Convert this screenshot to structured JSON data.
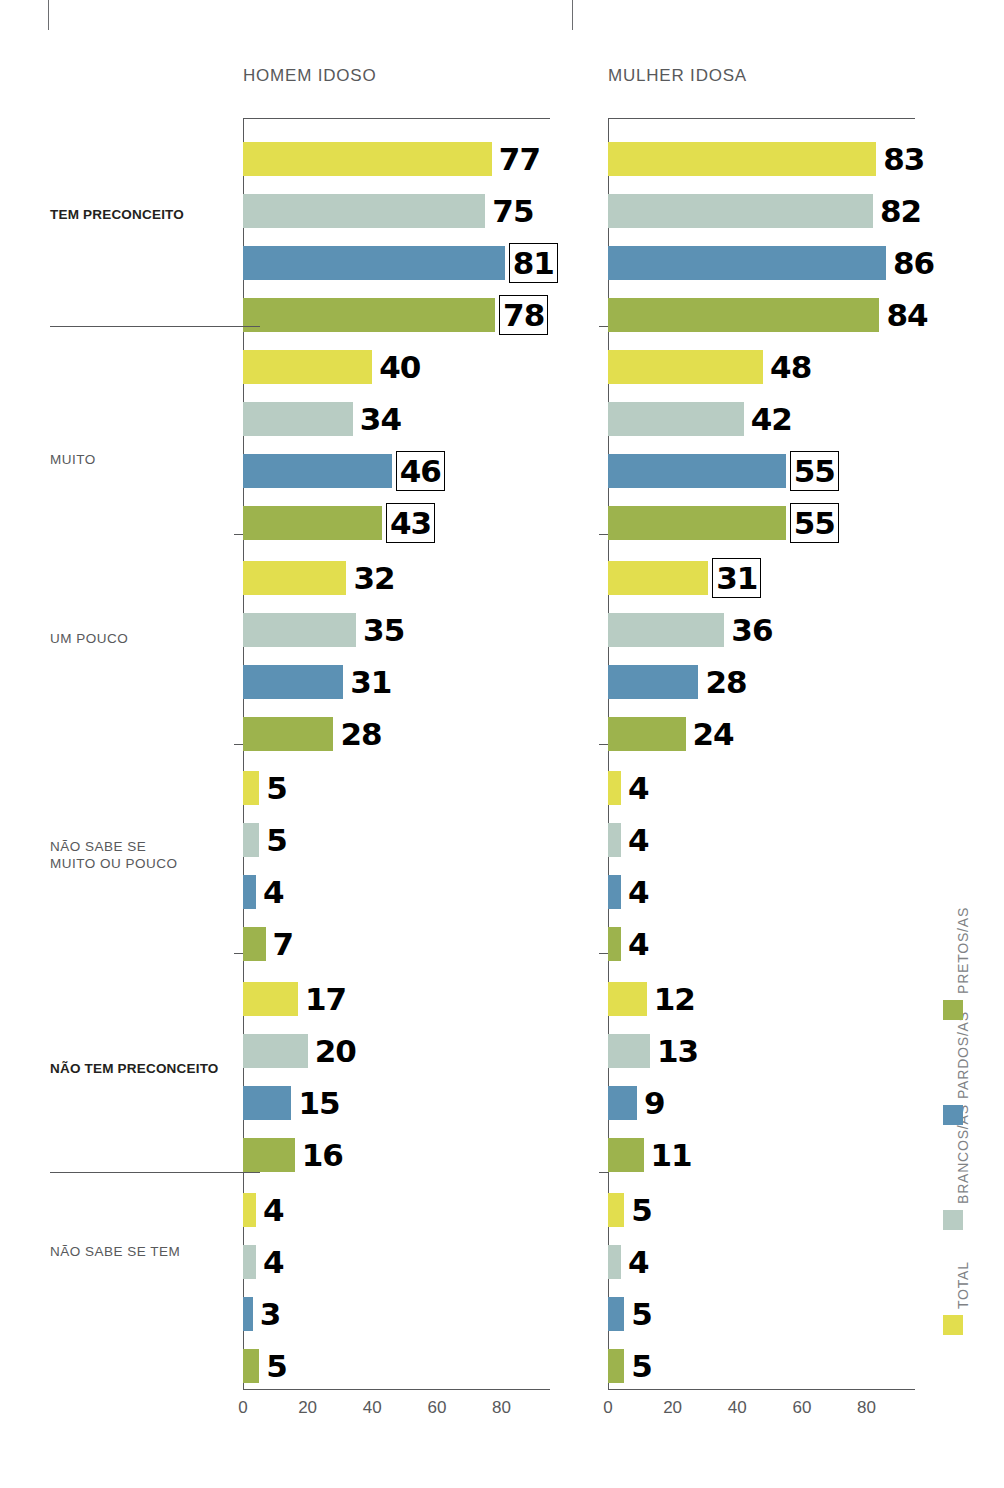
{
  "panels": [
    {
      "id": "homem",
      "title": "HOMEM IDOSO"
    },
    {
      "id": "mulher",
      "title": "MULHER IDOSA"
    }
  ],
  "categories": [
    {
      "label": "TEM PRECONCEITO",
      "bold": true
    },
    {
      "label": "MUITO",
      "bold": false
    },
    {
      "label": "UM POUCO",
      "bold": false
    },
    {
      "label": "NÃO SABE SE\nMUITO OU POUCO",
      "bold": false
    },
    {
      "label": "NÃO TEM PRECONCEITO",
      "bold": true
    },
    {
      "label": "NÃO SABE SE TEM",
      "bold": false
    }
  ],
  "legend": {
    "items": [
      {
        "name": "TOTAL",
        "color": "#e2de4e"
      },
      {
        "name": "BRANCOS/AS",
        "color": "#b8ccc3"
      },
      {
        "name": "PARDOS/AS",
        "color": "#5c91b4"
      },
      {
        "name": "PRETOS/AS",
        "color": "#9db34d"
      }
    ]
  },
  "axis": {
    "ticks": [
      0,
      20,
      40,
      60,
      80
    ],
    "tick_labels": [
      "0",
      "20",
      "40",
      "60",
      "80"
    ],
    "xmin": 0,
    "xmax": 95
  },
  "chart_data": {
    "type": "bar",
    "title": "",
    "xlabel": "",
    "ylabel": "",
    "xlim": [
      0,
      95
    ],
    "grid": false,
    "legend_position": "right-vertical",
    "orientation": "horizontal",
    "categories": [
      "TEM PRECONCEITO",
      "MUITO",
      "UM POUCO",
      "NÃO SABE SE MUITO OU POUCO",
      "NÃO TEM PRECONCEITO",
      "NÃO SABE SE TEM"
    ],
    "series_names": [
      "TOTAL",
      "BRANCOS/AS",
      "PARDOS/AS",
      "PRETOS/AS"
    ],
    "panels": [
      {
        "name": "HOMEM IDOSO",
        "series": [
          {
            "name": "TOTAL",
            "values": [
              77,
              40,
              32,
              5,
              17,
              4
            ],
            "highlighted": [
              false,
              false,
              false,
              false,
              false,
              false
            ]
          },
          {
            "name": "BRANCOS/AS",
            "values": [
              75,
              34,
              35,
              5,
              20,
              4
            ],
            "highlighted": [
              false,
              false,
              false,
              false,
              false,
              false
            ]
          },
          {
            "name": "PARDOS/AS",
            "values": [
              81,
              46,
              31,
              4,
              15,
              3
            ],
            "highlighted": [
              true,
              true,
              false,
              false,
              false,
              false
            ]
          },
          {
            "name": "PRETOS/AS",
            "values": [
              78,
              43,
              28,
              7,
              16,
              5
            ],
            "highlighted": [
              true,
              true,
              false,
              false,
              false,
              false
            ]
          }
        ]
      },
      {
        "name": "MULHER IDOSA",
        "series": [
          {
            "name": "TOTAL",
            "values": [
              83,
              48,
              31,
              4,
              12,
              5
            ],
            "highlighted": [
              false,
              false,
              true,
              false,
              false,
              false
            ]
          },
          {
            "name": "BRANCOS/AS",
            "values": [
              82,
              42,
              36,
              4,
              13,
              4
            ],
            "highlighted": [
              false,
              false,
              false,
              false,
              false,
              false
            ]
          },
          {
            "name": "PARDOS/AS",
            "values": [
              86,
              55,
              28,
              4,
              9,
              5
            ],
            "highlighted": [
              false,
              true,
              false,
              false,
              false,
              false
            ]
          },
          {
            "name": "PRETOS/AS",
            "values": [
              84,
              55,
              24,
              4,
              11,
              5
            ],
            "highlighted": [
              false,
              true,
              false,
              false,
              false,
              false
            ]
          }
        ]
      }
    ]
  }
}
